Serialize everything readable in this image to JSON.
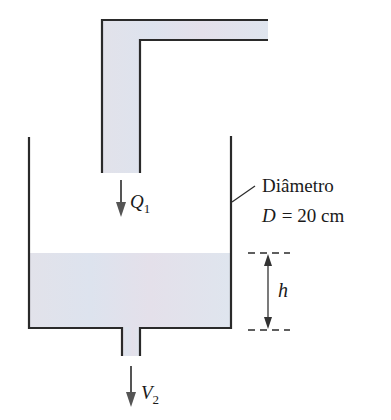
{
  "diagram": {
    "inflow": {
      "symbol": "Q",
      "subscript": "1"
    },
    "outflow": {
      "symbol": "V",
      "subscript": "2"
    },
    "tank_label": {
      "line1": "Diâmetro",
      "line2_var": "D",
      "line2_rest": "= 20 cm"
    },
    "height_label": "h"
  },
  "colors": {
    "stroke": "#2a2a2a",
    "water": "#dfe2ec",
    "text": "#1a1a1a",
    "arrow": "#555555"
  }
}
